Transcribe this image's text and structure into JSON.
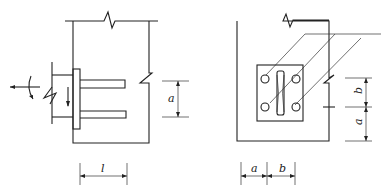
{
  "diagram": {
    "left_view": {
      "name": "side elevation of embedded plate with anchor bars",
      "dimension_labels": {
        "spacing": "a",
        "anchor_length": "l"
      }
    },
    "right_view": {
      "name": "front elevation of embedded plate with four anchors",
      "dimension_labels": {
        "horizontal_edge": "a",
        "horizontal_spacing": "b",
        "vertical_spacing": "b",
        "vertical_spacing_sub": "1",
        "vertical_edge": "a",
        "vertical_edge_sub": "1"
      }
    }
  }
}
